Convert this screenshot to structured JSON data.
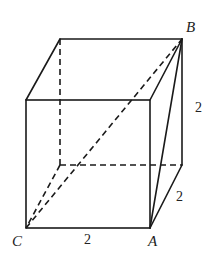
{
  "diagram": {
    "type": "cube",
    "vertices": {
      "B": "B",
      "C": "C",
      "A": "A"
    },
    "edge_labels": {
      "vertical_right": "2",
      "depth_right": "2",
      "bottom_front": "2"
    },
    "colors": {
      "line": "#1a1a1a",
      "background": "#ffffff"
    }
  }
}
